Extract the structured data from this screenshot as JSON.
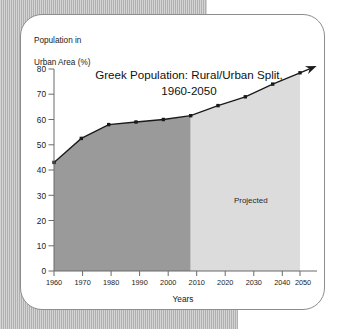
{
  "figure": {
    "y_axis_caption_line1": "Population in",
    "y_axis_caption_line2": "Urban Area (%)"
  },
  "chart_data": {
    "type": "area",
    "title_line1": "Greek Population: Rural/Urban Split,",
    "title_line2": "1960-2050",
    "xlabel": "Years",
    "ylabel": "Population in Urban Area (%)",
    "categories": [
      "1960",
      "1970",
      "1980",
      "1990",
      "2000",
      "2010",
      "2020",
      "2030",
      "2040",
      "2050"
    ],
    "x": [
      1960,
      1970,
      1980,
      1990,
      2000,
      2010,
      2020,
      2030,
      2040,
      2050
    ],
    "values": [
      43,
      52.5,
      58,
      59,
      60,
      61.5,
      65.5,
      69,
      74,
      78.5
    ],
    "series": [
      {
        "name": "Urban population share (%)",
        "values": [
          43,
          52.5,
          58,
          59,
          60,
          61.5,
          65.5,
          69,
          74,
          78.5
        ]
      }
    ],
    "xlim": [
      1960,
      2050
    ],
    "ylim": [
      0,
      80
    ],
    "y_ticks": [
      "0",
      "10",
      "20",
      "30",
      "40",
      "50",
      "60",
      "70",
      "80"
    ],
    "x_ticks": [
      "1960",
      "1970",
      "1980",
      "1990",
      "2000",
      "2010",
      "2020",
      "2030",
      "2040",
      "2050"
    ],
    "grid": false,
    "legend": "none",
    "annotations": [
      {
        "name": "projected-label",
        "text": "Projected",
        "x": 2032,
        "y": 27
      }
    ],
    "regions": [
      {
        "name": "historical",
        "from": 1960,
        "to": 2010,
        "color": "#9a9a9a"
      },
      {
        "name": "projected",
        "from": 2010,
        "to": 2050,
        "color": "#dcdcdc"
      }
    ],
    "line_color": "#1a1a1a",
    "marker_color": "#1a1a1a",
    "axis_color": "#6b6b6b",
    "arrow_at_end": true
  }
}
